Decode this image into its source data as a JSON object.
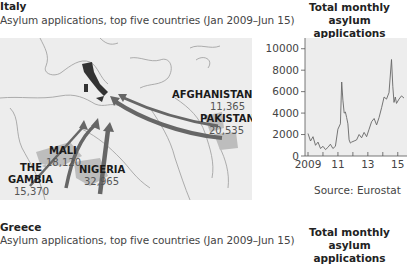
{
  "italy": {
    "title": "Italy",
    "subtitle": "Asylum applications, top five countries (Jan 2009–Jun 15)",
    "map": {
      "destination": "Italy",
      "origins": [
        {
          "name": "AFGHANISTAN",
          "value": "11,365"
        },
        {
          "name": "PAKISTAN",
          "value": "20,535"
        },
        {
          "name": "MALI",
          "value": "18,120"
        },
        {
          "name": "THE",
          "name2": "GAMBIA",
          "value": "15,370"
        },
        {
          "name": "NIGERIA",
          "value": "32,965"
        }
      ],
      "colors": {
        "arrow": "#666666",
        "highlight": "#bdbdbd",
        "italy": "#333333",
        "land": "#ededed",
        "border": "#9a9a9a"
      }
    },
    "chart_title_line1": "Total monthly",
    "chart_title_line2": "asylum applications",
    "source": "Source: Eurostat"
  },
  "greece": {
    "title": "Greece",
    "subtitle": "Asylum applications, top five countries (Jan 2009–Jun 15)",
    "chart_title_line1": "Total monthly",
    "chart_title_line2": "asylum applications"
  },
  "chart_data": {
    "type": "line",
    "title": "Total monthly asylum applications",
    "subtitle": "Italy",
    "xlabel": "",
    "ylabel": "",
    "x_ticks": [
      "2009",
      "11",
      "13",
      "15"
    ],
    "y_ticks": [
      "0",
      "2000",
      "4000",
      "6000",
      "8000",
      "10000"
    ],
    "ylim": [
      0,
      11000
    ],
    "xlim": [
      "Jan 2009",
      "Jun 2015"
    ],
    "grid": false,
    "source": "Source: Eurostat",
    "series": [
      {
        "name": "Italy total monthly asylum applications",
        "x": [
          "2009-01",
          "2009-03",
          "2009-05",
          "2009-07",
          "2009-09",
          "2009-11",
          "2010-01",
          "2010-03",
          "2010-05",
          "2010-07",
          "2010-09",
          "2010-11",
          "2011-01",
          "2011-03",
          "2011-04",
          "2011-05",
          "2011-06",
          "2011-07",
          "2011-08",
          "2011-09",
          "2011-10",
          "2011-11",
          "2011-12",
          "2012-02",
          "2012-04",
          "2012-06",
          "2012-08",
          "2012-10",
          "2012-12",
          "2013-02",
          "2013-04",
          "2013-06",
          "2013-08",
          "2013-10",
          "2013-12",
          "2014-02",
          "2014-04",
          "2014-06",
          "2014-08",
          "2014-09",
          "2014-10",
          "2014-11",
          "2014-12",
          "2015-02",
          "2015-04",
          "2015-06"
        ],
        "values": [
          2100,
          1400,
          1800,
          1000,
          1300,
          700,
          900,
          600,
          800,
          1100,
          700,
          900,
          2500,
          3000,
          6900,
          5200,
          4000,
          4100,
          3600,
          3000,
          1500,
          1200,
          1300,
          1400,
          1500,
          2000,
          1700,
          2200,
          1800,
          2500,
          3200,
          3500,
          2900,
          3600,
          4500,
          5500,
          5300,
          5900,
          9000,
          6500,
          5000,
          5500,
          4900,
          5300,
          5600,
          5400
        ]
      }
    ]
  }
}
